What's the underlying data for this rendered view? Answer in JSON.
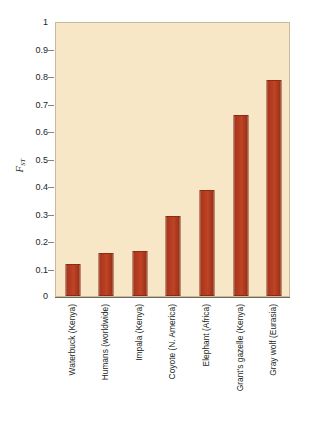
{
  "chart_data": {
    "type": "bar",
    "title": "",
    "subtitle": "",
    "xlabel": "",
    "ylabel": "FST",
    "ylabel_base": "F",
    "ylabel_sub": "ST",
    "ylim": [
      0,
      1
    ],
    "yticks": [
      "1",
      "0.9",
      "0.8",
      "0.7",
      "0.6",
      "0.5",
      "0.4",
      "0.3",
      "0.2",
      "0.1",
      "0"
    ],
    "ytick_values": [
      1,
      0.9,
      0.8,
      0.7,
      0.6,
      0.5,
      0.4,
      0.3,
      0.2,
      0.1,
      0
    ],
    "grid": false,
    "legend": null,
    "categories": [
      "Waterbuck (Kenya)",
      "Humans (worldwide)",
      "Impala (Kenya)",
      "Coyote (N. America)",
      "Elephant (Africa)",
      "Grant's gazelle (Kenya)",
      "Gray wolf (Eurasia)"
    ],
    "values": [
      0.115,
      0.155,
      0.165,
      0.29,
      0.385,
      0.66,
      0.785
    ],
    "series": [
      {
        "name": "FST",
        "values": [
          0.115,
          0.155,
          0.165,
          0.29,
          0.385,
          0.66,
          0.785
        ]
      }
    ],
    "colors": {
      "bar_fill": "#b53c20",
      "bar_edge": "#8a2c15",
      "plot_background": "#f7e7c6",
      "plot_border": "#c9bb9a",
      "axis_line": "#6f6a5e",
      "text": "#231f20",
      "page_background": "#ffffff"
    }
  }
}
